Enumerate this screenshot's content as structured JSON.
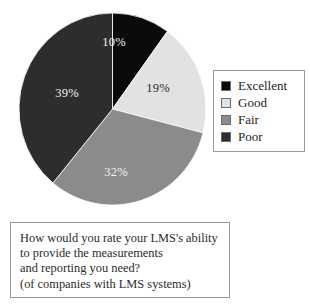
{
  "chart_data": {
    "type": "pie",
    "title": "",
    "subtitle": "",
    "categories": [
      "Excellent",
      "Good",
      "Fair",
      "Poor"
    ],
    "values": [
      10,
      19,
      32,
      39
    ],
    "value_unit": "%",
    "data_labels": [
      "10%",
      "19%",
      "32%",
      "39%"
    ],
    "colors": [
      "#0b0b0b",
      "#e2e2e2",
      "#8b8b8b",
      "#2d2d2d"
    ],
    "label_text_colors": [
      "#f2f2f2",
      "#2a2a2a",
      "#f2f2f2",
      "#f2f2f2"
    ],
    "start_angle_deg": 0,
    "direction": "clockwise",
    "legend_position": "right",
    "grid": false,
    "xlabel": "",
    "ylabel": "",
    "annotations": [
      "How would you rate your LMS's ability",
      "to provide the measurements",
      "and reporting you need?",
      "(of companies with LMS systems)"
    ]
  },
  "pie": {
    "slices": [
      {
        "label": "Excellent",
        "percent_text": "10%",
        "value": 10,
        "color": "#0b0b0b"
      },
      {
        "label": "Good",
        "percent_text": "19%",
        "value": 19,
        "color": "#e2e2e2"
      },
      {
        "label": "Fair",
        "percent_text": "32%",
        "value": 32,
        "color": "#8b8b8b"
      },
      {
        "label": "Poor",
        "percent_text": "39%",
        "value": 39,
        "color": "#2d2d2d"
      }
    ]
  },
  "legend": {
    "items": [
      {
        "label": "Excellent",
        "color": "#0b0b0b"
      },
      {
        "label": "Good",
        "color": "#e2e2e2"
      },
      {
        "label": "Fair",
        "color": "#8b8b8b"
      },
      {
        "label": "Poor",
        "color": "#2d2d2d"
      }
    ]
  },
  "caption": {
    "lines": [
      "How would you rate your LMS's ability",
      "to provide the measurements",
      "and reporting you need?",
      "(of companies with LMS systems)"
    ]
  },
  "colors": {
    "excellent": "#0b0b0b",
    "good": "#e2e2e2",
    "fair": "#8b8b8b",
    "poor": "#2d2d2d",
    "border": "#9a9a9a",
    "background": "#ffffff"
  }
}
